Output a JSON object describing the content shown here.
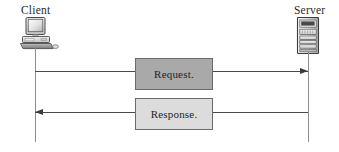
{
  "diagram": {
    "type": "sequence-diagram",
    "title": "",
    "actors": [
      {
        "id": "client",
        "label": "Client",
        "icon": "desktop-computer-icon"
      },
      {
        "id": "server",
        "label": "Server",
        "icon": "tower-server-icon"
      }
    ],
    "messages": [
      {
        "id": "request",
        "label": "Request.",
        "from": "client",
        "to": "server",
        "direction": "left-to-right",
        "box_color": "#a9a9a9"
      },
      {
        "id": "response",
        "label": "Response.",
        "from": "server",
        "to": "client",
        "direction": "right-to-left",
        "box_color": "#dcdcdc"
      }
    ],
    "colors": {
      "background": "#ffffff",
      "line": "#4a4a4a",
      "lifeline": "#8d8d8d",
      "box_border": "#6a6a6a",
      "text": "#1f1f1f"
    }
  }
}
